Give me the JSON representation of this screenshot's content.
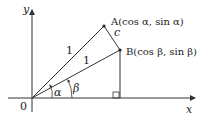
{
  "diagram": {
    "axes": {
      "x_label": "x",
      "y_label": "y",
      "origin_label": "0"
    },
    "points": {
      "A": {
        "label": "A(cos α, sin α)"
      },
      "B": {
        "label": "B(cos β, sin β)"
      }
    },
    "segments": {
      "OA_length": "1",
      "OB_length": "1",
      "AB_label": "c"
    },
    "angles": {
      "alpha": "α",
      "beta": "β"
    },
    "colors": {
      "line": "#333333",
      "text": "#222222",
      "background": "#ffffff"
    }
  }
}
